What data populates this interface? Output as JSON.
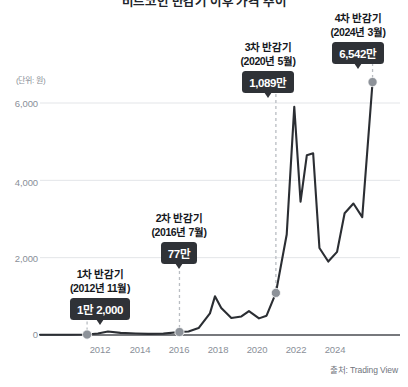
{
  "title": "비트코인 반감기 이후 가격 추이",
  "source": "출처: Trading View",
  "unit_label": "(단위: 원)",
  "axis": {
    "y_ticks": [
      "0",
      "2,000",
      "4,000",
      "6,000"
    ],
    "x_ticks": [
      "2012",
      "2014",
      "2016",
      "2018",
      "2020",
      "2022",
      "2024"
    ]
  },
  "annotations": [
    {
      "id": "halving-1",
      "head": "1차 반감기",
      "sub": "(2012년 11월)",
      "badge": "1만 2,000",
      "year": 2012.87,
      "value": 12
    },
    {
      "id": "halving-2",
      "head": "2차 반감기",
      "sub": "(2016년 7월)",
      "badge": "77만",
      "year": 2016.54,
      "value": 77
    },
    {
      "id": "halving-3",
      "head": "3차 반감기",
      "sub": "(2020년 5월)",
      "badge": "1,089만",
      "year": 2020.37,
      "value": 1089
    },
    {
      "id": "halving-4",
      "head": "4차 반감기",
      "sub": "(2024년 3월)",
      "badge": "6,542만",
      "year": 2024.21,
      "value": 6542
    }
  ],
  "colors": {
    "line": "#2b2e33",
    "marker": "#8d9299",
    "badge_bg": "#2f3237",
    "grid": "#e3e5e8",
    "axis_text": "#8a8f98",
    "dashed": "#b9bdc2",
    "background": "#ffffff"
  },
  "chart_data": {
    "type": "line",
    "title": "비트코인 반감기 이후 가격 추이",
    "xlabel": "",
    "ylabel": "(단위: 원)",
    "xlim": [
      2011.0,
      2025.3
    ],
    "ylim": [
      0,
      6800
    ],
    "grid": true,
    "legend": false,
    "y_ticks": [
      0,
      2000,
      4000,
      6000
    ],
    "x_ticks": [
      2012,
      2014,
      2016,
      2018,
      2020,
      2022,
      2024
    ],
    "series": [
      {
        "name": "비트코인 가격 (만 원)",
        "x": [
          2011.0,
          2011.6,
          2012.2,
          2012.87,
          2013.3,
          2013.7,
          2014.2,
          2014.8,
          2015.3,
          2015.9,
          2016.54,
          2016.9,
          2017.3,
          2017.75,
          2017.95,
          2018.2,
          2018.6,
          2019.0,
          2019.3,
          2019.7,
          2020.0,
          2020.37,
          2020.8,
          2021.1,
          2021.35,
          2021.6,
          2021.85,
          2022.1,
          2022.45,
          2022.8,
          2023.1,
          2023.45,
          2023.8,
          2024.21
        ],
        "y": [
          5,
          6,
          8,
          12,
          40,
          90,
          55,
          40,
          30,
          35,
          77,
          90,
          180,
          560,
          1000,
          700,
          440,
          480,
          620,
          430,
          500,
          1089,
          2600,
          5900,
          3450,
          4650,
          4700,
          2250,
          1900,
          2150,
          3150,
          3400,
          3050,
          6542
        ]
      }
    ],
    "markers": [
      {
        "x": 2012.87,
        "y": 12,
        "label": "1만 2,000"
      },
      {
        "x": 2016.54,
        "y": 77,
        "label": "77만"
      },
      {
        "x": 2020.37,
        "y": 1089,
        "label": "1,089만"
      },
      {
        "x": 2024.21,
        "y": 6542,
        "label": "6,542만"
      }
    ]
  }
}
